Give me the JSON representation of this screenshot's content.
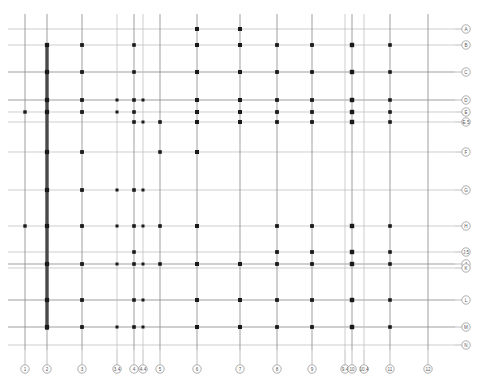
{
  "drawing": {
    "title": "Structural Column Grid Plan",
    "type": "architectural-grid-plan",
    "sheet_bg": "#ffffff",
    "colors": {
      "grid_line_light": "#b9b9b9",
      "grid_line_medium": "#8f8f8f",
      "grid_line_dark": "#555555",
      "column_dot": "#1a1a1a",
      "shear_wall": "#4a4a4a",
      "bubble_stroke": "#8a8a8a",
      "bubble_fill": "#ffffff",
      "bubble_text": "#555555"
    }
  },
  "grid_data": {
    "type": "grid-plan",
    "canvas": {
      "width": 480,
      "height": 385
    },
    "extents": {
      "horizontal_line_x_start": 8,
      "horizontal_line_x_end": 455,
      "vertical_line_y_start": 14,
      "vertical_line_y_end": 350
    },
    "vertical_grids": [
      {
        "label": "1",
        "x": 25,
        "weight": "medium",
        "bubble": true
      },
      {
        "label": "2",
        "x": 47,
        "weight": "medium",
        "bubble": true
      },
      {
        "label": "3",
        "x": 82,
        "weight": "medium",
        "bubble": true
      },
      {
        "label": "3.4",
        "x": 117,
        "weight": "light",
        "bubble": true
      },
      {
        "label": "4",
        "x": 134,
        "weight": "medium",
        "bubble": true
      },
      {
        "label": "4.4",
        "x": 143,
        "weight": "light",
        "bubble": true
      },
      {
        "label": "5",
        "x": 160,
        "weight": "medium",
        "bubble": true
      },
      {
        "label": "6",
        "x": 197,
        "weight": "medium",
        "bubble": true
      },
      {
        "label": "7",
        "x": 240,
        "weight": "medium",
        "bubble": true
      },
      {
        "label": "8",
        "x": 277,
        "weight": "medium",
        "bubble": true
      },
      {
        "label": "9",
        "x": 312,
        "weight": "medium",
        "bubble": true
      },
      {
        "label": "9.4",
        "x": 345,
        "weight": "light",
        "bubble": true
      },
      {
        "label": "10",
        "x": 352,
        "weight": "medium",
        "bubble": true
      },
      {
        "label": "10.4",
        "x": 364,
        "weight": "light",
        "bubble": true
      },
      {
        "label": "11",
        "x": 390,
        "weight": "medium",
        "bubble": true
      },
      {
        "label": "12",
        "x": 428,
        "weight": "medium",
        "bubble": true
      }
    ],
    "horizontal_grids": [
      {
        "label": "A",
        "y": 29,
        "weight": "light",
        "bubble": true
      },
      {
        "label": "B",
        "y": 45,
        "weight": "light",
        "bubble": true
      },
      {
        "label": "C",
        "y": 72,
        "weight": "medium",
        "bubble": true
      },
      {
        "label": "D",
        "y": 100,
        "weight": "medium",
        "bubble": true
      },
      {
        "label": "E",
        "y": 112,
        "weight": "light",
        "bubble": true
      },
      {
        "label": "E.5",
        "y": 122,
        "weight": "light",
        "bubble": true
      },
      {
        "label": "F",
        "y": 152,
        "weight": "light",
        "bubble": true
      },
      {
        "label": "G",
        "y": 190,
        "weight": "light",
        "bubble": true
      },
      {
        "label": "H",
        "y": 226,
        "weight": "light",
        "bubble": true
      },
      {
        "label": "J.5",
        "y": 252,
        "weight": "light",
        "bubble": true
      },
      {
        "label": "J",
        "y": 264,
        "weight": "medium",
        "bubble": true
      },
      {
        "label": "K",
        "y": 268,
        "weight": "light",
        "bubble": true
      },
      {
        "label": "L",
        "y": 300,
        "weight": "medium",
        "bubble": true
      },
      {
        "label": "M",
        "y": 327,
        "weight": "medium",
        "bubble": true
      },
      {
        "label": "N",
        "y": 345,
        "weight": "light",
        "bubble": true
      }
    ],
    "bubble_rails": {
      "right_axis_x": 466,
      "bottom_axis_y": 369,
      "bubble_radius": 4.2,
      "leader_gap": 11
    },
    "columns": [
      {
        "x": 47,
        "y": 45,
        "size": 4.2
      },
      {
        "x": 47,
        "y": 72,
        "size": 4.2
      },
      {
        "x": 47,
        "y": 100,
        "size": 4.2
      },
      {
        "x": 47,
        "y": 112,
        "size": 4.2
      },
      {
        "x": 47,
        "y": 152,
        "size": 4.2
      },
      {
        "x": 47,
        "y": 190,
        "size": 4.2
      },
      {
        "x": 47,
        "y": 226,
        "size": 4.2
      },
      {
        "x": 47,
        "y": 264,
        "size": 4.2
      },
      {
        "x": 47,
        "y": 300,
        "size": 4.2
      },
      {
        "x": 47,
        "y": 327,
        "size": 4.2
      },
      {
        "x": 25,
        "y": 112,
        "size": 3.4
      },
      {
        "x": 25,
        "y": 226,
        "size": 3.4
      },
      {
        "x": 82,
        "y": 45,
        "size": 3.8
      },
      {
        "x": 82,
        "y": 72,
        "size": 3.8
      },
      {
        "x": 82,
        "y": 100,
        "size": 3.8
      },
      {
        "x": 82,
        "y": 112,
        "size": 3.8
      },
      {
        "x": 82,
        "y": 152,
        "size": 3.8
      },
      {
        "x": 82,
        "y": 190,
        "size": 3.8
      },
      {
        "x": 82,
        "y": 226,
        "size": 3.8
      },
      {
        "x": 82,
        "y": 264,
        "size": 3.8
      },
      {
        "x": 82,
        "y": 300,
        "size": 3.8
      },
      {
        "x": 82,
        "y": 327,
        "size": 3.8
      },
      {
        "x": 117,
        "y": 100,
        "size": 3.0
      },
      {
        "x": 117,
        "y": 112,
        "size": 3.0
      },
      {
        "x": 117,
        "y": 190,
        "size": 3.0
      },
      {
        "x": 117,
        "y": 226,
        "size": 3.0
      },
      {
        "x": 117,
        "y": 264,
        "size": 3.0
      },
      {
        "x": 117,
        "y": 327,
        "size": 3.0
      },
      {
        "x": 134,
        "y": 45,
        "size": 3.6
      },
      {
        "x": 134,
        "y": 72,
        "size": 3.6
      },
      {
        "x": 134,
        "y": 100,
        "size": 3.6
      },
      {
        "x": 134,
        "y": 112,
        "size": 3.6
      },
      {
        "x": 134,
        "y": 122,
        "size": 3.6
      },
      {
        "x": 134,
        "y": 190,
        "size": 3.6
      },
      {
        "x": 134,
        "y": 226,
        "size": 3.6
      },
      {
        "x": 134,
        "y": 252,
        "size": 3.6
      },
      {
        "x": 134,
        "y": 264,
        "size": 3.6
      },
      {
        "x": 134,
        "y": 300,
        "size": 3.6
      },
      {
        "x": 134,
        "y": 327,
        "size": 3.6
      },
      {
        "x": 143,
        "y": 100,
        "size": 3.0
      },
      {
        "x": 143,
        "y": 122,
        "size": 3.0
      },
      {
        "x": 143,
        "y": 190,
        "size": 3.0
      },
      {
        "x": 143,
        "y": 226,
        "size": 3.0
      },
      {
        "x": 143,
        "y": 264,
        "size": 3.0
      },
      {
        "x": 143,
        "y": 300,
        "size": 3.0
      },
      {
        "x": 143,
        "y": 327,
        "size": 3.0
      },
      {
        "x": 160,
        "y": 122,
        "size": 3.6
      },
      {
        "x": 160,
        "y": 152,
        "size": 3.6
      },
      {
        "x": 160,
        "y": 226,
        "size": 3.6
      },
      {
        "x": 160,
        "y": 264,
        "size": 3.6
      },
      {
        "x": 197,
        "y": 29,
        "size": 4.0
      },
      {
        "x": 197,
        "y": 45,
        "size": 4.0
      },
      {
        "x": 197,
        "y": 72,
        "size": 4.0
      },
      {
        "x": 197,
        "y": 100,
        "size": 4.0
      },
      {
        "x": 197,
        "y": 112,
        "size": 4.0
      },
      {
        "x": 197,
        "y": 122,
        "size": 4.0
      },
      {
        "x": 197,
        "y": 152,
        "size": 4.0
      },
      {
        "x": 197,
        "y": 226,
        "size": 4.0
      },
      {
        "x": 197,
        "y": 264,
        "size": 4.0
      },
      {
        "x": 197,
        "y": 300,
        "size": 4.0
      },
      {
        "x": 197,
        "y": 327,
        "size": 4.0
      },
      {
        "x": 240,
        "y": 29,
        "size": 4.0
      },
      {
        "x": 240,
        "y": 45,
        "size": 4.0
      },
      {
        "x": 240,
        "y": 72,
        "size": 4.0
      },
      {
        "x": 240,
        "y": 100,
        "size": 4.0
      },
      {
        "x": 240,
        "y": 112,
        "size": 4.0
      },
      {
        "x": 240,
        "y": 122,
        "size": 4.0
      },
      {
        "x": 240,
        "y": 264,
        "size": 4.0
      },
      {
        "x": 240,
        "y": 300,
        "size": 4.0
      },
      {
        "x": 240,
        "y": 327,
        "size": 4.0
      },
      {
        "x": 277,
        "y": 45,
        "size": 3.8
      },
      {
        "x": 277,
        "y": 72,
        "size": 3.8
      },
      {
        "x": 277,
        "y": 100,
        "size": 3.8
      },
      {
        "x": 277,
        "y": 112,
        "size": 3.8
      },
      {
        "x": 277,
        "y": 122,
        "size": 3.8
      },
      {
        "x": 277,
        "y": 226,
        "size": 3.8
      },
      {
        "x": 277,
        "y": 252,
        "size": 3.8
      },
      {
        "x": 277,
        "y": 264,
        "size": 3.8
      },
      {
        "x": 277,
        "y": 300,
        "size": 3.8
      },
      {
        "x": 277,
        "y": 327,
        "size": 3.8
      },
      {
        "x": 312,
        "y": 45,
        "size": 3.8
      },
      {
        "x": 312,
        "y": 72,
        "size": 3.8
      },
      {
        "x": 312,
        "y": 100,
        "size": 3.8
      },
      {
        "x": 312,
        "y": 112,
        "size": 3.8
      },
      {
        "x": 312,
        "y": 122,
        "size": 3.8
      },
      {
        "x": 312,
        "y": 226,
        "size": 3.8
      },
      {
        "x": 312,
        "y": 252,
        "size": 3.8
      },
      {
        "x": 312,
        "y": 264,
        "size": 3.8
      },
      {
        "x": 312,
        "y": 300,
        "size": 3.8
      },
      {
        "x": 312,
        "y": 327,
        "size": 3.8
      },
      {
        "x": 352,
        "y": 45,
        "size": 4.4
      },
      {
        "x": 352,
        "y": 72,
        "size": 4.4
      },
      {
        "x": 352,
        "y": 100,
        "size": 4.4
      },
      {
        "x": 352,
        "y": 112,
        "size": 4.4
      },
      {
        "x": 352,
        "y": 122,
        "size": 4.4
      },
      {
        "x": 352,
        "y": 226,
        "size": 4.4
      },
      {
        "x": 352,
        "y": 252,
        "size": 4.4
      },
      {
        "x": 352,
        "y": 264,
        "size": 4.4
      },
      {
        "x": 352,
        "y": 300,
        "size": 4.4
      },
      {
        "x": 352,
        "y": 327,
        "size": 4.4
      },
      {
        "x": 390,
        "y": 45,
        "size": 3.6
      },
      {
        "x": 390,
        "y": 72,
        "size": 3.6
      },
      {
        "x": 390,
        "y": 100,
        "size": 3.6
      },
      {
        "x": 390,
        "y": 112,
        "size": 3.6
      },
      {
        "x": 390,
        "y": 122,
        "size": 3.6
      },
      {
        "x": 390,
        "y": 226,
        "size": 3.6
      },
      {
        "x": 390,
        "y": 252,
        "size": 3.6
      },
      {
        "x": 390,
        "y": 264,
        "size": 3.6
      },
      {
        "x": 390,
        "y": 300,
        "size": 3.6
      },
      {
        "x": 390,
        "y": 327,
        "size": 3.6
      }
    ],
    "shear_walls": [
      {
        "x": 47,
        "y_start": 44,
        "y_end": 330,
        "thickness": 3.4
      }
    ]
  }
}
